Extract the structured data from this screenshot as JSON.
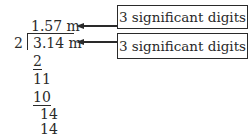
{
  "division": {
    "quotient": "1.57 m",
    "divisor": "2",
    "dividend": "3.14 m",
    "steps": [
      "2",
      "11",
      "10",
      "14",
      "14"
    ]
  },
  "annotations": [
    {
      "label": "3 significant digits",
      "points_to": "quotient"
    },
    {
      "label": "3 significant digits",
      "points_to": "dividend"
    }
  ]
}
